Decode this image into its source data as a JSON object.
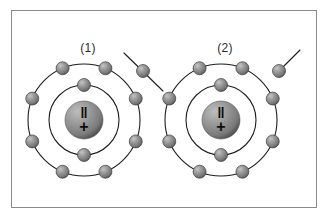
{
  "figure": {
    "background_color": "#ffffff",
    "border_color": "#8a8a8a",
    "frame": {
      "x": 11,
      "y": 10,
      "width": 306,
      "height": 198
    }
  },
  "colors": {
    "orbit_stroke": "#1d1d1d",
    "electron_light": "#b7b7b7",
    "electron_mid": "#8e8e8e",
    "electron_dark": "#4a4a4a",
    "nucleus_light": "#a9a9a9",
    "nucleus_mid": "#7d7d7d",
    "nucleus_dark": "#3c3c3c",
    "nucleus_sign": "#0d0d0d",
    "label_text": "#2b2b2b"
  },
  "chart_data": {
    "type": "diagram",
    "title": "",
    "atoms": [
      {
        "id": "atom-1",
        "label": "(1)",
        "label_x": 88,
        "label_y": 52,
        "center_x": 84,
        "center_y": 120,
        "nucleus_radius": 19,
        "nucleus_symbol_top": "‖",
        "nucleus_symbol_bottom": "+",
        "shells": [
          {
            "name": "inner-shell",
            "radius": 35,
            "electron_count": 2,
            "electron_angles_deg": [
              270,
              90
            ]
          },
          {
            "name": "outer-shell",
            "radius": 56,
            "electron_count": 8,
            "electron_angles_deg": [
              247.5,
              292.5,
              337.5,
              22.5,
              67.5,
              112.5,
              157.5,
              202.5
            ]
          }
        ],
        "free_electron": {
          "name": "escaping-electron",
          "x": 143,
          "y": 71,
          "radius": 6.5,
          "trajectory": {
            "x1": 124,
            "y1": 53,
            "x2": 163,
            "y2": 91
          }
        }
      },
      {
        "id": "atom-2",
        "label": "(2)",
        "label_x": 225,
        "label_y": 52,
        "center_x": 221,
        "center_y": 120,
        "nucleus_radius": 19,
        "nucleus_symbol_top": "‖",
        "nucleus_symbol_bottom": "+",
        "shells": [
          {
            "name": "inner-shell",
            "radius": 35,
            "electron_count": 2,
            "electron_angles_deg": [
              270,
              90
            ]
          },
          {
            "name": "outer-shell",
            "radius": 56,
            "electron_count": 8,
            "electron_angles_deg": [
              247.5,
              292.5,
              337.5,
              22.5,
              67.5,
              112.5,
              157.5,
              202.5
            ]
          }
        ],
        "free_electron": {
          "name": "escaping-electron",
          "x": 279,
          "y": 71,
          "radius": 6.5,
          "trajectory": {
            "x1": 283,
            "y1": 67,
            "x2": 300,
            "y2": 50
          }
        }
      }
    ],
    "electron_radius": 6.5,
    "legend": [],
    "annotations": [
      "(1)",
      "(2)"
    ]
  }
}
